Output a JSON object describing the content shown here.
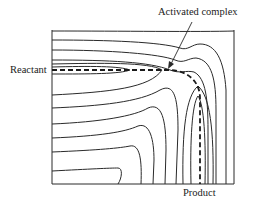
{
  "diagram": {
    "labels": {
      "activated_complex": "Activated complex",
      "reactant": "Reactant",
      "product": "Product"
    },
    "colors": {
      "line": "#2a2a2a",
      "background": "#ffffff"
    }
  }
}
